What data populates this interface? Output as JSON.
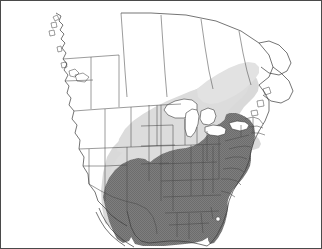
{
  "map": {
    "title": "North America species distribution range map",
    "projection_note": "Continental United States with southern Canada and northern Mexico",
    "frame_border_color": "#4a4a4a",
    "background_color": "#ffffff",
    "boundary_line_color": "#3a3a3a",
    "coastline_color": "#3a3a3a",
    "legend_visible": false,
    "labels_visible": false,
    "regions": [
      {
        "name": "core-range",
        "fill_color": "#7a7a7a",
        "texture": "stipple",
        "description": "Dark gray shaded core range covering the eastern and southeastern United States from Texas and the eastern Great Plains east to the Atlantic coast and north to the Great Lakes and New England"
      },
      {
        "name": "extended-range",
        "fill_color": "#d8d8d8",
        "texture": "solid",
        "description": "Light gray shaded peripheral range extending north and west of the core range across the northern Great Plains, upper Midwest, southern Ontario and Quebec, and the western fringe into the central plains"
      },
      {
        "name": "outside-range",
        "fill_color": "#ffffff",
        "texture": "none",
        "description": "Unshaded area covering the western United States, western Canada, and Mexico"
      }
    ],
    "water_features": [
      {
        "name": "great-lakes",
        "fill_color": "#ffffff"
      },
      {
        "name": "lake-okeechobee",
        "fill_color": "#ffffff"
      }
    ]
  }
}
